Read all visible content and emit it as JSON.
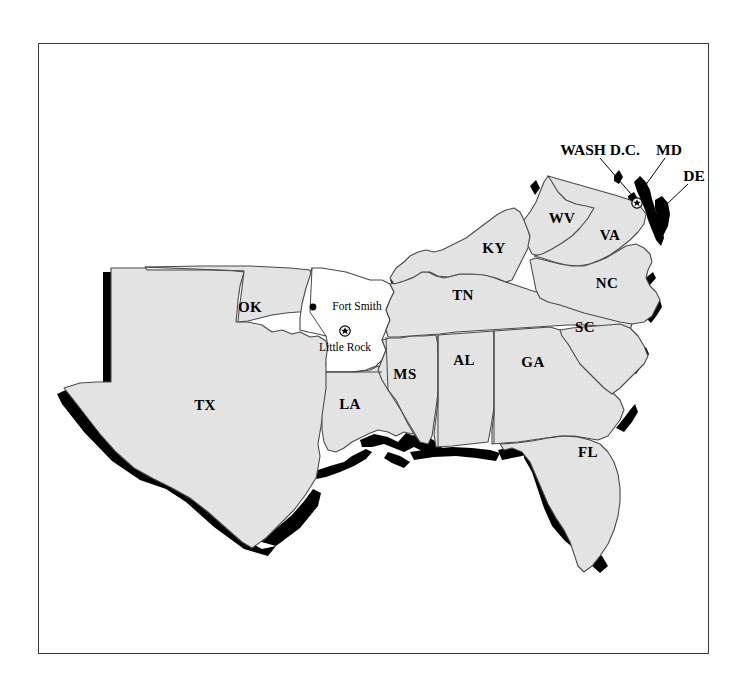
{
  "figure": {
    "type": "map",
    "region_title": "Southeastern United States",
    "frame": {
      "x": 38,
      "y": 43,
      "width": 671,
      "height": 611
    },
    "colors": {
      "land_fill": "#e3e3e3",
      "highlight_fill": "#ffffff",
      "border_stroke": "#4a4a4a",
      "shadow_fill": "#000000",
      "frame_stroke": "#3a3a3a",
      "background": "#ffffff"
    }
  },
  "state_labels": [
    {
      "name": "OK",
      "x": 250,
      "y": 307
    },
    {
      "name": "TX",
      "x": 205,
      "y": 405
    },
    {
      "name": "LA",
      "x": 350,
      "y": 404
    },
    {
      "name": "MS",
      "x": 405,
      "y": 374
    },
    {
      "name": "AL",
      "x": 464,
      "y": 360
    },
    {
      "name": "GA",
      "x": 533,
      "y": 362
    },
    {
      "name": "FL",
      "x": 588,
      "y": 452
    },
    {
      "name": "TN",
      "x": 463,
      "y": 295
    },
    {
      "name": "KY",
      "x": 494,
      "y": 248
    },
    {
      "name": "WV",
      "x": 562,
      "y": 218
    },
    {
      "name": "VA",
      "x": 610,
      "y": 235
    },
    {
      "name": "NC",
      "x": 607,
      "y": 283
    },
    {
      "name": "SC",
      "x": 585,
      "y": 327
    }
  ],
  "callouts": [
    {
      "name": "WASH D.C.",
      "x": 600,
      "y": 150,
      "leader_to_x": 637,
      "leader_to_y": 203
    },
    {
      "name": "MD",
      "x": 669,
      "y": 150,
      "leader_to_x": 649,
      "leader_to_y": 182
    },
    {
      "name": "DE",
      "x": 694,
      "y": 176,
      "leader_to_x": 665,
      "leader_to_y": 203
    }
  ],
  "cities": [
    {
      "name": "Fort Smith",
      "marker": "dot",
      "marker_x": 313,
      "marker_y": 307,
      "label_x": 357,
      "label_y": 306
    },
    {
      "name": "Little Rock",
      "marker": "capital-star",
      "marker_x": 345,
      "marker_y": 331,
      "label_x": 345,
      "label_y": 347
    },
    {
      "name": "",
      "marker": "capital-star",
      "marker_x": 637,
      "marker_y": 203,
      "label_x": 0,
      "label_y": 0
    }
  ],
  "unlabeled_highlight": {
    "note": "Arkansas rendered unshaded (white) as the highlighted state"
  }
}
